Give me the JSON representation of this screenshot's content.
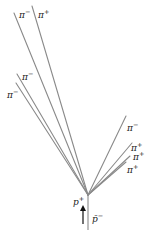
{
  "diagram": {
    "vertex": {
      "x": 88,
      "y": 195
    },
    "beam": {
      "x1": 88,
      "y1": 195,
      "x2": 88,
      "y2": 230,
      "label_incoming": "p̄",
      "charge_incoming": "−",
      "label_target": "p",
      "charge_target": "+"
    },
    "arrow": {
      "x": 83,
      "y_top": 206,
      "y_bottom": 224,
      "color": "#111111"
    },
    "tracks": [
      {
        "particle": "π",
        "charge": "−",
        "x2": 14,
        "y2": 13,
        "label_x": 19,
        "label_y": 9
      },
      {
        "particle": "π",
        "charge": "+",
        "x2": 32,
        "y2": 6,
        "label_x": 38,
        "label_y": 9
      },
      {
        "particle": "π",
        "charge": "−",
        "x2": 17,
        "y2": 74,
        "label_x": 22,
        "label_y": 71
      },
      {
        "particle": "π",
        "charge": "−",
        "x2": 16,
        "y2": 83,
        "label_x": 7,
        "label_y": 89
      },
      {
        "particle": "π",
        "charge": "−",
        "x2": 126,
        "y2": 116,
        "label_x": 127,
        "label_y": 122
      },
      {
        "particle": "π",
        "charge": "+",
        "x2": 132,
        "y2": 143,
        "label_x": 131,
        "label_y": 143
      },
      {
        "particle": "π",
        "charge": "+",
        "x2": 130,
        "y2": 156,
        "label_x": 133,
        "label_y": 152
      },
      {
        "particle": "π",
        "charge": "+",
        "x2": 126,
        "y2": 162,
        "label_x": 127,
        "label_y": 164
      }
    ],
    "labels": {
      "t0": {
        "base": "π",
        "sup": "−"
      },
      "t1": {
        "base": "π",
        "sup": "+"
      },
      "t2": {
        "base": "π",
        "sup": "−"
      },
      "t3": {
        "base": "π",
        "sup": "−"
      },
      "t4": {
        "base": "π",
        "sup": "−"
      },
      "t5": {
        "base": "π",
        "sup": "+"
      },
      "t6": {
        "base": "π",
        "sup": "+"
      },
      "t7": {
        "base": "π",
        "sup": "+"
      },
      "proton": {
        "base": "p",
        "sup": "+"
      },
      "antiproton": {
        "base": "p̄",
        "sup": "−"
      }
    },
    "colors": {
      "track": "#8a8a8a",
      "text": "#222222",
      "background": "#ffffff"
    }
  }
}
